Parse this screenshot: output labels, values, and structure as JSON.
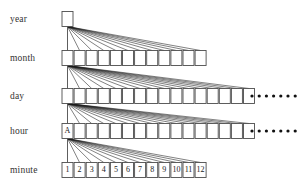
{
  "diagram": {
    "background_color": "#ffffff",
    "box_stroke_color": "#4d4d4d",
    "edge_color": "#1a1a1a",
    "label_color": "#333333",
    "levels": [
      {
        "id": "year",
        "label": "year",
        "y": 19,
        "node_count": 1,
        "nodes": [
          ""
        ],
        "has_ellipsis": false,
        "ellipsis_dots": 0
      },
      {
        "id": "month",
        "label": "month",
        "y": 58,
        "node_count": 12,
        "nodes": [
          "",
          "",
          "",
          "",
          "",
          "",
          "",
          "",
          "",
          "",
          "",
          ""
        ],
        "has_ellipsis": false,
        "ellipsis_dots": 0
      },
      {
        "id": "day",
        "label": "day",
        "y": 96,
        "node_count": 16,
        "nodes": [
          "",
          "",
          "",
          "",
          "",
          "",
          "",
          "",
          "",
          "",
          "",
          "",
          "",
          "",
          "",
          ""
        ],
        "has_ellipsis": true,
        "ellipsis_dots": 7
      },
      {
        "id": "hour",
        "label": "hour",
        "y": 131,
        "node_count": 16,
        "nodes": [
          "A",
          "",
          "",
          "",
          "",
          "",
          "",
          "",
          "",
          "",
          "",
          "",
          "",
          "",
          "",
          ""
        ],
        "has_ellipsis": true,
        "ellipsis_dots": 7
      },
      {
        "id": "minute",
        "label": "minute",
        "y": 170,
        "node_count": 12,
        "nodes": [
          "1",
          "2",
          "3",
          "4",
          "5",
          "6",
          "7",
          "8",
          "9",
          "10",
          "11",
          "12"
        ],
        "has_ellipsis": false,
        "ellipsis_dots": 0
      }
    ],
    "labels": {
      "year": "year",
      "month": "month",
      "day": "day",
      "hour": "hour",
      "minute": "minute"
    },
    "annotated_nodes": {
      "hour_first": "A",
      "minute_sequence": [
        "1",
        "2",
        "3",
        "4",
        "5",
        "6",
        "7",
        "8",
        "9",
        "10",
        "11",
        "12"
      ]
    },
    "geometry": {
      "label_x": 10,
      "first_box_x": 62,
      "box_width": 11,
      "box_height": 15,
      "box_pitch": 12.1,
      "ellipsis_start_x": 252,
      "ellipsis_dot_pitch": 7.2,
      "ellipsis_dot_radius": 1.6
    }
  }
}
